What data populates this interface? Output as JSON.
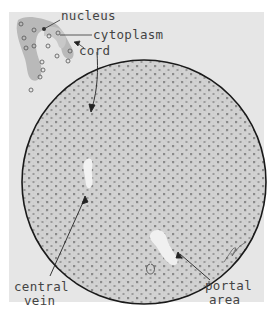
{
  "figure": {
    "background": "#e6e6e6",
    "tissue_fill": "#d4d4d4",
    "nucleus_color": "#8a8a8a",
    "outline_color": "#1a1a1a"
  },
  "labels": {
    "nucleus": "nucleus",
    "cytoplasm": "cytoplasm",
    "cord": "cord",
    "central_vein_line1": "central",
    "central_vein_line2": "vein",
    "portal_area_line1": "portal",
    "portal_area_line2": "area"
  },
  "signature": "artist signature"
}
